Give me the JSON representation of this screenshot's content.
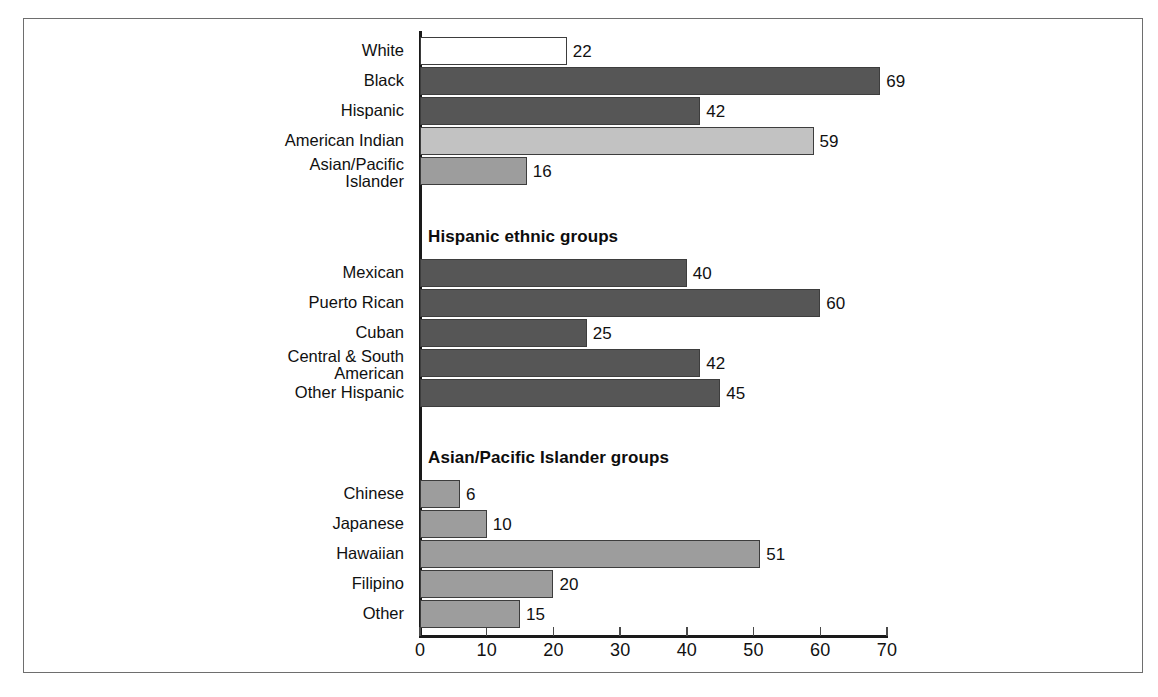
{
  "chart_data": {
    "type": "bar",
    "orientation": "horizontal",
    "title": "",
    "xlabel": "",
    "ylabel": "",
    "xlim": [
      0,
      70
    ],
    "grid": false,
    "legend": false,
    "ticks": [
      0,
      10,
      20,
      30,
      40,
      50,
      60,
      70
    ],
    "sections": [
      {
        "header": "",
        "categories": [
          "White",
          "Black",
          "Hispanic",
          "American Indian",
          "Asian/Pacific Islander"
        ],
        "values": [
          22,
          69,
          42,
          59,
          16
        ],
        "colors": [
          "#ffffff",
          "#565656",
          "#565656",
          "#c2c2c2",
          "#9d9d9d"
        ]
      },
      {
        "header": "Hispanic ethnic groups",
        "categories": [
          "Mexican",
          "Puerto Rican",
          "Cuban",
          "Central & South American",
          "Other Hispanic"
        ],
        "values": [
          40,
          60,
          25,
          42,
          45
        ],
        "colors": [
          "#565656",
          "#565656",
          "#565656",
          "#565656",
          "#565656"
        ]
      },
      {
        "header": "Asian/Pacific Islander groups",
        "categories": [
          "Chinese",
          "Japanese",
          "Hawaiian",
          "Filipino",
          "Other"
        ],
        "values": [
          6,
          10,
          51,
          20,
          15
        ],
        "colors": [
          "#9d9d9d",
          "#9d9d9d",
          "#9d9d9d",
          "#9d9d9d",
          "#9d9d9d"
        ]
      }
    ]
  },
  "axis": {
    "tick_labels": [
      "0",
      "10",
      "20",
      "30",
      "40",
      "50",
      "60",
      "70"
    ]
  },
  "rows": [
    {
      "label": "White",
      "label_line2": "",
      "value": "22"
    },
    {
      "label": "Black",
      "label_line2": "",
      "value": "69"
    },
    {
      "label": "Hispanic",
      "label_line2": "",
      "value": "42"
    },
    {
      "label": "American Indian",
      "label_line2": "",
      "value": "59"
    },
    {
      "label": "Asian/Pacific",
      "label_line2": "Islander",
      "value": "16"
    },
    {
      "label": "Mexican",
      "label_line2": "",
      "value": "40"
    },
    {
      "label": "Puerto Rican",
      "label_line2": "",
      "value": "60"
    },
    {
      "label": "Cuban",
      "label_line2": "",
      "value": "25"
    },
    {
      "label": "Central & South",
      "label_line2": "American",
      "value": "42"
    },
    {
      "label": "Other Hispanic",
      "label_line2": "",
      "value": "45"
    },
    {
      "label": "Chinese",
      "label_line2": "",
      "value": "6"
    },
    {
      "label": "Japanese",
      "label_line2": "",
      "value": "10"
    },
    {
      "label": "Hawaiian",
      "label_line2": "",
      "value": "51"
    },
    {
      "label": "Filipino",
      "label_line2": "",
      "value": "20"
    },
    {
      "label": "Other",
      "label_line2": "",
      "value": "15"
    }
  ],
  "section_headers": {
    "hispanic": "Hispanic ethnic groups",
    "asian": "Asian/Pacific Islander groups"
  },
  "colors": {
    "dark_gray": "#565656",
    "light_gray": "#c2c2c2",
    "medium_gray": "#9d9d9d",
    "white": "#ffffff",
    "bar_outline": "#3d3d3d",
    "axis": "#1a1a1a",
    "frame": "#6e6e6e"
  }
}
